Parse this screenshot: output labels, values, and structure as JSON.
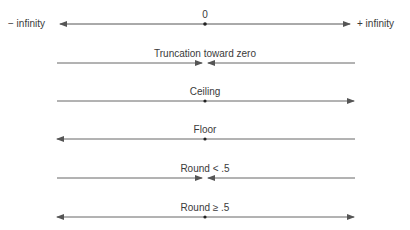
{
  "axis": {
    "zero_label": "0",
    "left_label": "− infinity",
    "right_label": "+ infinity"
  },
  "rows": [
    {
      "label": "Truncation toward zero",
      "direction": "toward-zero"
    },
    {
      "label": "Ceiling",
      "direction": "right"
    },
    {
      "label": "Floor",
      "direction": "left"
    },
    {
      "label": "Round < .5",
      "direction": "toward-center"
    },
    {
      "label": "Round ≥ .5",
      "direction": "both-outward"
    }
  ],
  "colors": {
    "line": "#555555",
    "text": "#3a3a3a"
  }
}
